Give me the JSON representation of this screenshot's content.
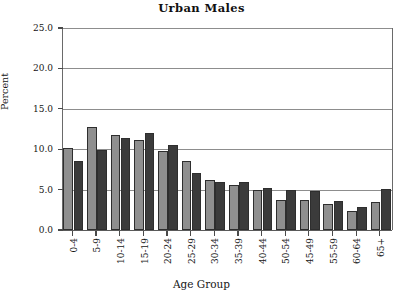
{
  "chart_data": {
    "type": "bar",
    "title": "Urban Males",
    "xlabel": "Age Group",
    "ylabel": "Percent",
    "ylim": [
      0.0,
      25.0
    ],
    "ytick_labels": [
      "0.0",
      "5.0",
      "10.0",
      "15.0",
      "20.0",
      "25.0"
    ],
    "ytick_values": [
      0.0,
      5.0,
      10.0,
      15.0,
      20.0,
      25.0
    ],
    "grid": true,
    "legend": "none",
    "categories": [
      "0-4",
      "5-9",
      "10-14",
      "15-19",
      "20-24",
      "25-29",
      "30-34",
      "35-39",
      "40-44",
      "50-54",
      "45-49",
      "55-59",
      "60-64",
      "65+"
    ],
    "series": [
      {
        "name": "series-light",
        "color": "#8f8f8f",
        "values": [
          10.2,
          12.7,
          11.7,
          11.1,
          9.8,
          8.5,
          6.2,
          5.6,
          4.9,
          3.7,
          3.7,
          3.2,
          2.4,
          3.5
        ]
      },
      {
        "name": "series-dark",
        "color": "#3b3b3b",
        "values": [
          8.6,
          9.9,
          11.4,
          12.0,
          10.5,
          7.0,
          5.9,
          5.9,
          5.2,
          4.9,
          4.8,
          3.6,
          2.8,
          5.1
        ]
      }
    ]
  },
  "colors": {
    "light_bar": "#8f8f8f",
    "dark_bar": "#3b3b3b",
    "grid": "#8d8d8d",
    "axis": "#5a5a5a",
    "text": "#151515"
  }
}
